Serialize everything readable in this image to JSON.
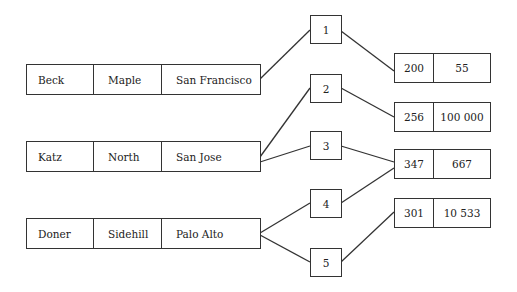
{
  "records": [
    {
      "name": "Beck",
      "street": "Maple",
      "city": "San Francisco"
    },
    {
      "name": "Katz",
      "street": "North",
      "city": "San Jose"
    },
    {
      "name": "Doner",
      "street": "Sidehill",
      "city": "Palo Alto"
    }
  ],
  "pointers": [
    "1",
    "2",
    "3",
    "4",
    "5"
  ],
  "values": [
    {
      "key": "200",
      "value": "55"
    },
    {
      "key": "256",
      "value": "100 000"
    },
    {
      "key": "347",
      "value": "667"
    },
    {
      "key": "301",
      "value": "10 533"
    }
  ],
  "links": [
    {
      "from": "record-Beck",
      "to": "pointer-1"
    },
    {
      "from": "record-Katz",
      "to": "pointer-2"
    },
    {
      "from": "record-Katz",
      "to": "pointer-3"
    },
    {
      "from": "record-Doner",
      "to": "pointer-4"
    },
    {
      "from": "record-Doner",
      "to": "pointer-5"
    },
    {
      "from": "pointer-1",
      "to": "value-200"
    },
    {
      "from": "pointer-2",
      "to": "value-256"
    },
    {
      "from": "pointer-3",
      "to": "value-347"
    },
    {
      "from": "pointer-4",
      "to": "value-347"
    },
    {
      "from": "pointer-5",
      "to": "value-301"
    }
  ]
}
